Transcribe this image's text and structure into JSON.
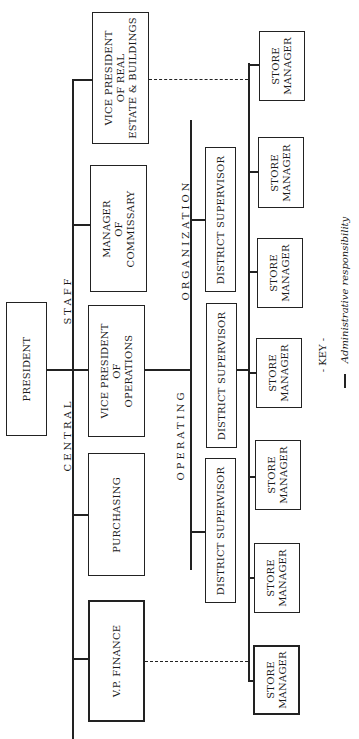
{
  "chart": {
    "orientation": "rotated-90-ccw",
    "root": {
      "label": "PRESIDENT"
    },
    "central_staff": {
      "section_label_left": "CENTRAL",
      "section_label_right": "STAFF",
      "units": [
        {
          "label": "V.P. FINANCE"
        },
        {
          "label": "PURCHASING"
        },
        {
          "label": "VICE PRESIDENT\nOF\nOPERATIONS"
        },
        {
          "label": "MANAGER\nOF\nCOMMISSARY"
        },
        {
          "label": "VICE PRESIDENT\nOF REAL\nESTATE & BUILDINGS"
        }
      ]
    },
    "operating_organization": {
      "section_label_left": "OPERATING",
      "section_label_right": "ORGANIZATION",
      "district_supervisors": [
        {
          "label": "DISTRICT SUPERVISOR"
        },
        {
          "label": "DISTRICT SUPERVISOR"
        },
        {
          "label": "DISTRICT SUPERVISOR"
        }
      ],
      "store_managers": [
        {
          "label": "STORE\nMANAGER"
        },
        {
          "label": "STORE\nMANAGER"
        },
        {
          "label": "STORE\nMANAGER"
        },
        {
          "label": "STORE\nMANAGER"
        },
        {
          "label": "STORE\nMANAGER"
        },
        {
          "label": "STORE\nMANAGER"
        },
        {
          "label": "STORE\nMANAGER"
        },
        {
          "label": "STORE\nMANAGER"
        }
      ]
    },
    "key": {
      "title": "- KEY -",
      "entries": [
        {
          "line": "solid",
          "label": "Administrative responsibility"
        }
      ]
    }
  }
}
